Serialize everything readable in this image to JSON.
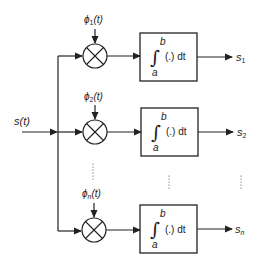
{
  "diagram": {
    "type": "correlator-receiver-block-diagram",
    "input": {
      "label": "s(t)"
    },
    "branches": [
      {
        "basis": "ϕ1(t)",
        "basis_main": "ϕ",
        "basis_sub": "1",
        "integral_lower": "a",
        "integral_upper": "b",
        "integrand": "(.) dt",
        "output_main": "s",
        "output_sub": "1"
      },
      {
        "basis": "ϕ2(t)",
        "basis_main": "ϕ",
        "basis_sub": "2",
        "integral_lower": "a",
        "integral_upper": "b",
        "integrand": "(.) dt",
        "output_main": "s",
        "output_sub": "2"
      },
      {
        "basis": "ϕn(t)",
        "basis_main": "ϕ",
        "basis_sub": "n",
        "integral_lower": "a",
        "integral_upper": "b",
        "integrand": "(.) dt",
        "output_main": "s",
        "output_sub": "n"
      }
    ],
    "basis_suffix": "(t)",
    "ellipsis": "⋮",
    "colors": {
      "stroke": "#222222",
      "background": "#ffffff"
    }
  }
}
